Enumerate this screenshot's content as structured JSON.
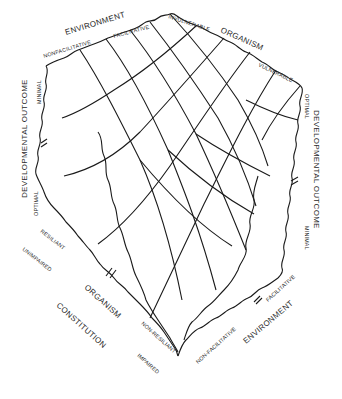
{
  "figure": {
    "type": "developmental-landscape-surface",
    "top_left_axis": {
      "title": "ENVIRONMENT",
      "low": "NONFACILITATIVE",
      "high": "FACILITATIVE"
    },
    "top_right_axis": {
      "title": "ORGANISM",
      "low": "INVULNERABLE",
      "high": "VULNERABLE"
    },
    "left_axis": {
      "title": "DEVELOPMENTAL OUTCOME",
      "top": "MINIMAL",
      "bottom": "OPTIMAL"
    },
    "right_axis": {
      "title": "DEVELOPMENTAL OUTCOME",
      "top": "OPTIMAL",
      "bottom": "MINIMAL"
    },
    "bottom_left_axis": {
      "title": "ORGANISM",
      "subtitle": "CONSTITUTION",
      "high": "RESILIANT",
      "high2": "UNIMPAIRED",
      "low": "NON-RESILIANT",
      "low2": "IMPAIRED"
    },
    "bottom_right_axis": {
      "title": "ENVIRONMENT",
      "high": "FACILITATIVE",
      "low": "NON-FACILITATIVE"
    },
    "colors": {
      "line": "#1a1a1a",
      "text": "#2a2a2a",
      "background": "#ffffff"
    }
  }
}
